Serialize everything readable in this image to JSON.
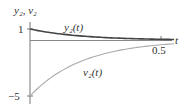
{
  "chart_data": {
    "type": "line",
    "title": "",
    "xlabel": "t",
    "ylabel": "y2, v2",
    "xlim": [
      0,
      0.55
    ],
    "ylim": [
      -5.3,
      1.3
    ],
    "x_ticks": [
      {
        "value": 0.5,
        "label": "0.5"
      }
    ],
    "y_ticks": [
      {
        "value": 1,
        "label": "1"
      },
      {
        "value": -5,
        "label": "−5"
      }
    ],
    "grid": false,
    "legend": "inline curve labels",
    "series": [
      {
        "name": "y2(t)",
        "color": "#444444",
        "x": [
          0,
          0.05,
          0.1,
          0.15,
          0.2,
          0.25,
          0.3,
          0.35,
          0.4,
          0.45,
          0.5,
          0.55
        ],
        "values": [
          1,
          0.78,
          0.61,
          0.47,
          0.37,
          0.29,
          0.22,
          0.17,
          0.14,
          0.11,
          0.08,
          0.06
        ]
      },
      {
        "name": "v2(t)",
        "color": "#aaaaaa",
        "x": [
          0,
          0.05,
          0.1,
          0.15,
          0.2,
          0.25,
          0.3,
          0.35,
          0.4,
          0.45,
          0.5,
          0.55
        ],
        "values": [
          -5,
          -3.89,
          -3.03,
          -2.36,
          -1.84,
          -1.43,
          -1.12,
          -0.87,
          -0.68,
          -0.53,
          -0.41,
          -0.32
        ]
      }
    ]
  },
  "labels": {
    "yaxis": "y₂, v₂",
    "xaxis": "t",
    "tick_y_top": "1",
    "tick_y_bottom": "−5",
    "tick_x": "0.5",
    "curve_y2": "y₂(t)",
    "curve_v2": "v₂(t)"
  }
}
